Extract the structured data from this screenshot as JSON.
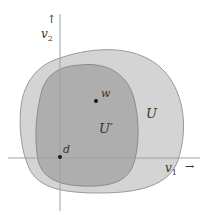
{
  "diagram": {
    "type": "nested-sets-in-plane",
    "colors": {
      "background": "#ffffff",
      "outer_fill": "#d4d4d4",
      "outer_stroke": "#9a9a9a",
      "inner_fill": "#aeaeae",
      "inner_stroke": "#8c8c8c",
      "axis": "#a0a0a0",
      "point": "#1a1a1a",
      "text": "#333333"
    },
    "axes": {
      "horizontal": {
        "label": "v",
        "subscript": "1",
        "arrow": "→"
      },
      "vertical": {
        "label": "v",
        "subscript": "2",
        "arrow": "↑"
      }
    },
    "regions": [
      {
        "id": "outer",
        "label": "U"
      },
      {
        "id": "inner",
        "label": "U′"
      }
    ],
    "points": [
      {
        "id": "w",
        "label": "w"
      },
      {
        "id": "d",
        "label": "d"
      }
    ]
  }
}
